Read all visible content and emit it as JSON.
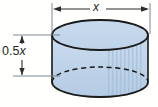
{
  "figure": {
    "shape": "cylinder",
    "background_color": "#fffffe",
    "labels": {
      "diameter": "x",
      "height_prefix": "0.5",
      "height_variable": "x",
      "height_full": "0.5x"
    },
    "colors": {
      "body_fill_top": "#c5d8ec",
      "body_fill_bottom": "#b9cfe6",
      "top_face_fill": "#c3d6ea",
      "outline": "#1a1a1a",
      "dimension_line": "#2b2b2b",
      "hatch_shading": "#a9c2dc",
      "label_text": "#231f20"
    },
    "geometry": {
      "cylinder_left_px": 52,
      "cylinder_right_px": 148,
      "top_ellipse_center_y_px": 35,
      "top_ellipse_rx_px": 48,
      "top_ellipse_ry_px": 15,
      "bottom_ellipse_center_y_px": 82,
      "bottom_ellipse_ry_px": 15,
      "hidden_back_arc": "dashed"
    },
    "dimension_lines": {
      "diameter": {
        "orientation": "horizontal",
        "y_px": 9,
        "x_start_px": 54,
        "x_end_px": 150,
        "arrowheads": "both-ends"
      },
      "height": {
        "orientation": "vertical",
        "x_px": 22,
        "y_start_px": 35,
        "y_end_px": 76,
        "arrowheads": "both-ends"
      }
    },
    "extension_lines": [
      {
        "name": "diameter-left-extension",
        "orientation": "vertical",
        "x_px": 52,
        "y_start_px": 3,
        "y_end_px": 38
      },
      {
        "name": "diameter-right-extension",
        "orientation": "vertical",
        "x_px": 150,
        "y_start_px": 3,
        "y_end_px": 38
      },
      {
        "name": "height-top-extension",
        "orientation": "horizontal",
        "y_px": 35,
        "x_start_px": 14,
        "x_end_px": 60
      },
      {
        "name": "height-bottom-extension",
        "orientation": "horizontal",
        "y_px": 76,
        "x_start_px": 14,
        "x_end_px": 60
      }
    ]
  }
}
